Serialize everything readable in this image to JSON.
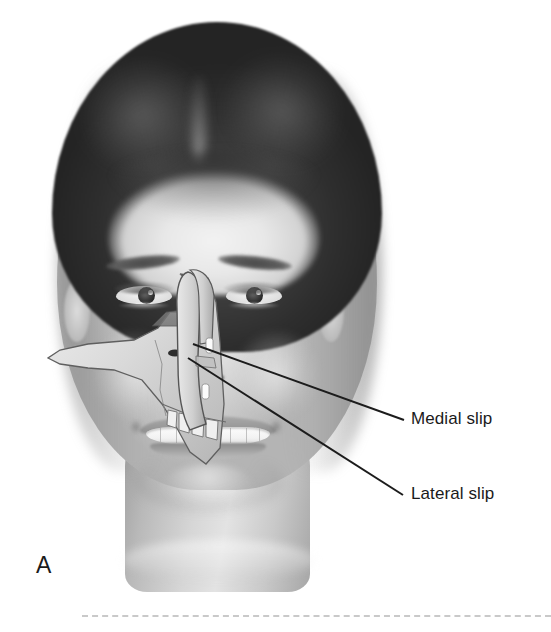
{
  "figure": {
    "panel_letter": "A",
    "overlay": "nasal-septum-and-maxilla-anatomical-cutaway"
  },
  "labels": [
    {
      "id": "medial-slip",
      "text": "Medial slip",
      "x": 411,
      "y": 409
    },
    {
      "id": "lateral-slip",
      "text": "Lateral slip",
      "x": 411,
      "y": 484
    }
  ],
  "leader_lines": [
    {
      "id": "leader-medial",
      "x1": 193,
      "y1": 344,
      "x2": 404,
      "y2": 420
    },
    {
      "id": "leader-lateral",
      "x1": 188,
      "y1": 358,
      "x2": 403,
      "y2": 495
    }
  ],
  "colors": {
    "label_text": "#1a1a1a",
    "leader_line": "#1c1c1c",
    "divider": "#c9c9c9",
    "background": "#ffffff"
  },
  "divider": {
    "style": "dashed",
    "x": 82,
    "y": 615,
    "width": 469
  }
}
